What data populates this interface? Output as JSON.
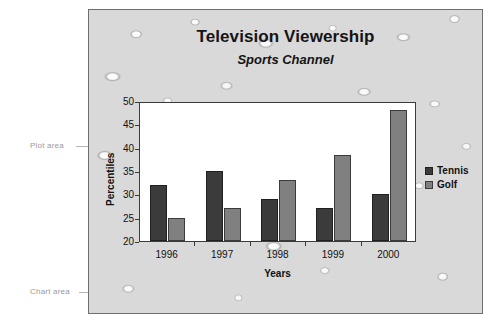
{
  "annotations": {
    "plot_area_label": "Plot area",
    "chart_area_label": "Chart area"
  },
  "chart_data": {
    "type": "bar",
    "title": "Television Viewership",
    "subtitle": "Sports Channel",
    "xlabel": "Years",
    "ylabel": "Percentiles",
    "categories": [
      "1996",
      "1997",
      "1998",
      "1999",
      "2000"
    ],
    "series": [
      {
        "name": "Tennis",
        "color": "#3b3b3b",
        "values": [
          32,
          35,
          29,
          27,
          30
        ]
      },
      {
        "name": "Golf",
        "color": "#808080",
        "values": [
          25,
          27,
          33,
          38.5,
          48
        ]
      }
    ],
    "ylim": [
      20,
      50
    ],
    "yticks": [
      20,
      25,
      30,
      35,
      40,
      45,
      50
    ],
    "grid": false,
    "legend_position": "right",
    "legend": [
      "Tennis",
      "Golf"
    ]
  }
}
